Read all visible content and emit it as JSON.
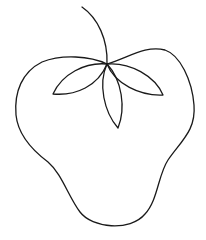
{
  "illustration": {
    "subject": "strawberry line drawing",
    "stroke_color": "#1a1a1a",
    "background_color": "#ffffff",
    "stroke_width": 1.3,
    "parts": [
      "stem",
      "body-outline",
      "leaf-left",
      "leaf-right",
      "leaf-center"
    ]
  }
}
